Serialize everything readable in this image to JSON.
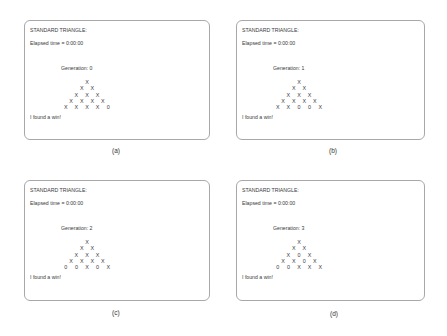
{
  "panels": [
    {
      "id": "a",
      "caption": "(a)",
      "title": "STANDARD TRIANGLE:",
      "elapsed": "Elapsed time = 0:00:00",
      "generation": "Generation:  0",
      "rows": [
        [
          "X"
        ],
        [
          "X",
          "X"
        ],
        [
          "X",
          "X",
          "X"
        ],
        [
          "X",
          "X",
          "X",
          "X"
        ],
        [
          "X",
          "X",
          "X",
          "X",
          "0"
        ]
      ],
      "message": "I found a win!"
    },
    {
      "id": "b",
      "caption": "(b)",
      "title": "STANDARD TRIANGLE:",
      "elapsed": "Elapsed time = 0:00:00",
      "generation": "Generation:  1",
      "rows": [
        [
          "X"
        ],
        [
          "X",
          "X"
        ],
        [
          "X",
          "X",
          "X"
        ],
        [
          "X",
          "X",
          "X",
          "X"
        ],
        [
          "X",
          "X",
          "0",
          "0",
          "X"
        ]
      ],
      "message": "I found a win!"
    },
    {
      "id": "c",
      "caption": "(c)",
      "title": "STANDARD TRIANGLE:",
      "elapsed": "Elapsed time = 0:00:00",
      "generation": "Generation:  2",
      "rows": [
        [
          "X"
        ],
        [
          "X",
          "X"
        ],
        [
          "X",
          "X",
          "X"
        ],
        [
          "X",
          "X",
          "X",
          "X"
        ],
        [
          "0",
          "0",
          "X",
          "0",
          "X"
        ]
      ],
      "message": "I found a win!"
    },
    {
      "id": "d",
      "caption": "(d)",
      "title": "STANDARD TRIANGLE:",
      "elapsed": "Elapsed time = 0:00:00",
      "generation": "Generation:  3",
      "rows": [
        [
          "X"
        ],
        [
          "X",
          "X"
        ],
        [
          "X",
          "0",
          "X"
        ],
        [
          "X",
          "X",
          "0",
          "X"
        ],
        [
          "0",
          "0",
          "X",
          "X",
          "X"
        ]
      ],
      "message": "I found a win!"
    }
  ]
}
